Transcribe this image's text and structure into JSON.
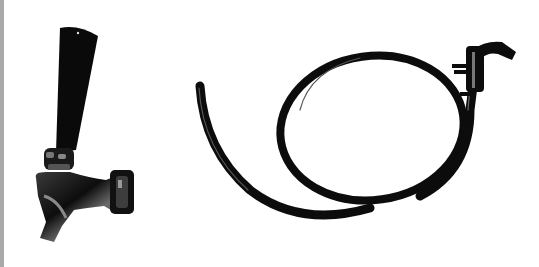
{
  "image": {
    "description": "Product photo of a black beer faucet tap and a coiled black beverage hose line with a coupler fitting on a white background",
    "background_color": "#ffffff",
    "edge_strip_color": "#a9a9a9",
    "objects": [
      {
        "name": "beer-faucet-tap",
        "position": "left",
        "color": "#111111"
      },
      {
        "name": "coiled-hose-line",
        "position": "right",
        "color": "#111111"
      }
    ]
  }
}
